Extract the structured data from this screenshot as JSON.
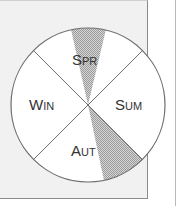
{
  "diagram": {
    "type": "season-wheel",
    "center": [
      88,
      105
    ],
    "radius": 77,
    "colors": {
      "panel": "#f1f1f1",
      "circle_fill": "#ffffff",
      "stroke": "#6e6e6e",
      "shade": "#bdbdbd",
      "text": "#333333"
    },
    "quadrants": [
      {
        "id": "spring",
        "label_big": "S",
        "label_small": "PR",
        "position": "top"
      },
      {
        "id": "summer",
        "label_big": "S",
        "label_small": "UM",
        "position": "right"
      },
      {
        "id": "autumn",
        "label_big": "A",
        "label_small": "UT",
        "position": "bottom"
      },
      {
        "id": "winter",
        "label_big": "W",
        "label_small": "IN",
        "position": "left"
      }
    ],
    "shaded_regions": [
      {
        "name": "spring-shaded-wedge",
        "description": "narrow wedge from top of circle converging to center"
      },
      {
        "name": "autumn-shaded-wedge",
        "description": "wedge in lower-right between diagonal divider and near-vertical line"
      }
    ]
  }
}
